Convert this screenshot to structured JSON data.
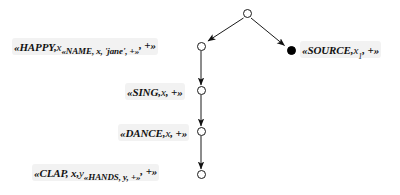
{
  "diagram": {
    "type": "directed-tree",
    "background_color": "#ffffff",
    "stroke_color": "#1a1a1a",
    "label_highlight_color": "#e8e8e8",
    "nodes": [
      {
        "id": "root",
        "shape": "open-circle",
        "x": 247,
        "y": 13,
        "label": ""
      },
      {
        "id": "happy",
        "shape": "open-circle",
        "x": 201,
        "y": 46,
        "label": "happy"
      },
      {
        "id": "source",
        "shape": "filled-circle",
        "x": 291,
        "y": 50,
        "label": "source"
      },
      {
        "id": "sing",
        "shape": "open-circle",
        "x": 201,
        "y": 90,
        "label": "sing"
      },
      {
        "id": "dance",
        "shape": "open-circle",
        "x": 201,
        "y": 131,
        "label": "dance"
      },
      {
        "id": "clap",
        "shape": "open-circle",
        "x": 201,
        "y": 174,
        "label": "clap"
      }
    ],
    "edges": [
      {
        "from": "root",
        "to": "happy",
        "arrow": "end"
      },
      {
        "from": "root",
        "to": "source",
        "arrow": "end"
      },
      {
        "from": "happy",
        "to": "sing",
        "arrow": "end"
      },
      {
        "from": "sing",
        "to": "dance",
        "arrow": "end"
      },
      {
        "from": "dance",
        "to": "clap",
        "arrow": "end"
      }
    ],
    "labels": {
      "happy": {
        "full_text": "«HAPPY, x«NAME, x, 'jane', +», +»",
        "head": "«HAPPY,",
        "var1": "x",
        "nested": "«NAME, x, 'jane', +»",
        "tail": ", +»",
        "position": "left"
      },
      "source": {
        "full_text": "«SOURCE, x₁, +»",
        "head": "«SOURCE,",
        "var1": "x",
        "subscript": "1",
        "tail": ", +»",
        "position": "right"
      },
      "sing": {
        "full_text": "«SING, x, +»",
        "head": "«SING,",
        "var1": "x",
        "tail": ", +»",
        "position": "left"
      },
      "dance": {
        "full_text": "«DANCE, x, +»",
        "head": "«DANCE,",
        "var1": "x",
        "tail": ", +»",
        "position": "left"
      },
      "clap": {
        "full_text": "«CLAP, x, y«HANDS, y, +», +»",
        "head": "«CLAP, x,",
        "var1": "y",
        "nested": "«HANDS, y, +»",
        "tail": ", +»",
        "position": "left"
      }
    }
  }
}
